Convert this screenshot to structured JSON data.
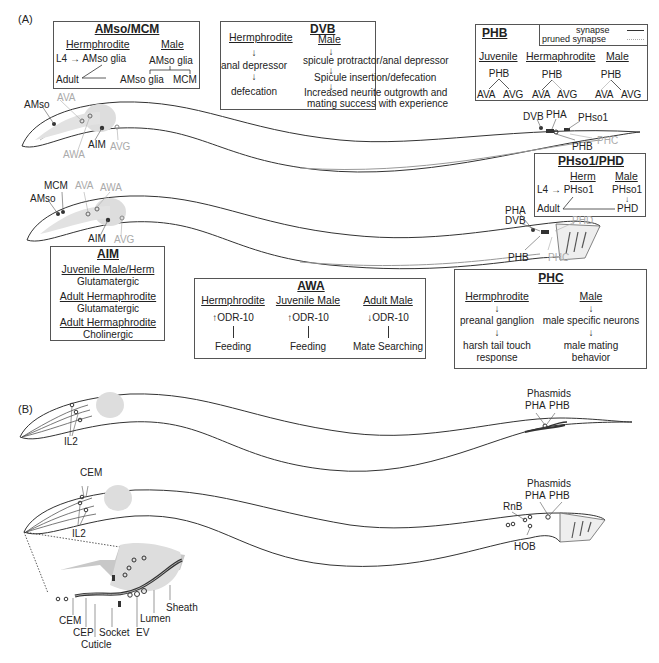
{
  "panels": {
    "a_label": "(A)",
    "b_label": "(B)"
  },
  "amso_mcm": {
    "title": "AMso/MCM",
    "herm_header": "Hermphrodite",
    "male_header": "Male",
    "l4": "L4",
    "herm_l4_target": "AMso glia",
    "adult": "Adult",
    "herm_adult_target": "AMso glia",
    "male_top": "AMso glia",
    "male_left": "AMso glia",
    "male_right": "MCM"
  },
  "dvb": {
    "title": "DVB",
    "herm_header": "Hermphrodite",
    "male_header": "Male",
    "herm_steps": [
      "anal depressor",
      "defecation"
    ],
    "male_steps": [
      "spicule protractor/anal depressor",
      "Spicule insertion/defecation",
      "Increased neurite outgrowth and",
      "mating success with experience"
    ]
  },
  "phb": {
    "title": "PHB",
    "legend": {
      "synapse": "synapse",
      "pruned": "pruned synapse"
    },
    "groups": [
      {
        "header": "Juvenile",
        "top": "PHB",
        "left": "AVA",
        "right": "AVG"
      },
      {
        "header": "Hermaphrodite",
        "top": "PHB",
        "left": "AVA",
        "right": "AVG"
      },
      {
        "header": "Male",
        "top": "PHB",
        "left": "AVA",
        "right": "AVG"
      }
    ]
  },
  "worm1_labels": {
    "amso": "AMso",
    "ava": "AVA",
    "awa": "AWA",
    "aim": "AIM",
    "avg": "AVG",
    "dvb": "DVB",
    "pha": "PHA",
    "phso1": "PHso1",
    "phb": "PHB",
    "phc": "PHC"
  },
  "worm2_labels": {
    "mcm": "MCM",
    "amso": "AMso",
    "ava": "AVA",
    "awa": "AWA",
    "aim": "AIM",
    "avg": "AVG",
    "pha": "PHA",
    "dvb": "DVB",
    "phd": "PHD",
    "phb": "PHB",
    "phc": "PHC"
  },
  "phso1_phd": {
    "title": "PHso1/PHD",
    "herm_header": "Herm",
    "male_header": "Male",
    "l4": "L4",
    "herm_l4_target": "PHso1",
    "male_top": "PHso1",
    "adult": "Adult",
    "male_bottom": "PHD"
  },
  "aim": {
    "title": "AIM",
    "rows": [
      {
        "header": "Juvenile Male/Herm",
        "value": "Glutamatergic"
      },
      {
        "header": "Adult Hermaphrodite",
        "value": "Glutamatergic"
      },
      {
        "header": "Adult Hermaphrodite",
        "value": "Cholinergic"
      }
    ]
  },
  "awa": {
    "title": "AWA",
    "columns": [
      {
        "header": "Hermphrodite",
        "arrow": "↑",
        "gene": "ODR-10",
        "outcome": "Feeding"
      },
      {
        "header": "Juvenile Male",
        "arrow": "↑",
        "gene": "ODR-10",
        "outcome": "Feeding"
      },
      {
        "header": "Adult Male",
        "arrow": "↓",
        "gene": "ODR-10",
        "outcome": "Mate Searching"
      }
    ]
  },
  "phc": {
    "title": "PHC",
    "herm_header": "Hermphrodite",
    "male_header": "Male",
    "herm_steps": [
      "preanal ganglion",
      "harsh tail touch",
      "response"
    ],
    "male_steps": [
      "male specific neurons",
      "male mating",
      "behavior"
    ]
  },
  "worm3_labels": {
    "il2": "IL2",
    "phasmids": "Phasmids",
    "pha": "PHA",
    "phb": "PHB"
  },
  "worm4_labels": {
    "cem": "CEM",
    "il2": "IL2",
    "phasmids": "Phasmids",
    "pha": "PHA",
    "phb": "PHB",
    "rnb": "RnB",
    "hob": "HOB"
  },
  "inset_labels": {
    "cem": "CEM",
    "cep": "CEP",
    "cuticle": "Cuticle",
    "socket": "Socket",
    "ev": "EV",
    "lumen": "Lumen",
    "sheath": "Sheath"
  },
  "colors": {
    "line": "#333333",
    "pruned": "#aaaaaa",
    "pharynx": "#d8d8d8",
    "glia": "#c8c8c8"
  }
}
